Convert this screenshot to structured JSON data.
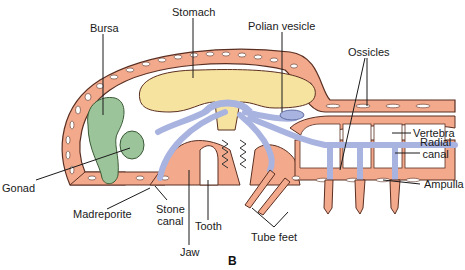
{
  "figure": {
    "panel_label": "B",
    "colors": {
      "body_wall": "#f2a98c",
      "body_wall_outline": "#5a2f22",
      "stomach": "#f7e3a0",
      "water_vascular": "#a9b3e0",
      "bursa_gonad": "#9cc49a",
      "ossicle": "#ffffff",
      "leader_line": "#1a1a1a"
    },
    "labels": {
      "bursa": "Bursa",
      "stomach": "Stomach",
      "polian_vesicle": "Polian vesicle",
      "ossicles": "Ossicles",
      "vertebra": "Vertebra",
      "radial_canal_line1": "Radial",
      "radial_canal_line2": "canal",
      "ampulla": "Ampulla",
      "gonad": "Gonad",
      "madreporite": "Madreporite",
      "stone_canal_line1": "Stone",
      "stone_canal_line2": "canal",
      "tooth": "Tooth",
      "jaw": "Jaw",
      "tube_feet": "Tube feet"
    }
  }
}
